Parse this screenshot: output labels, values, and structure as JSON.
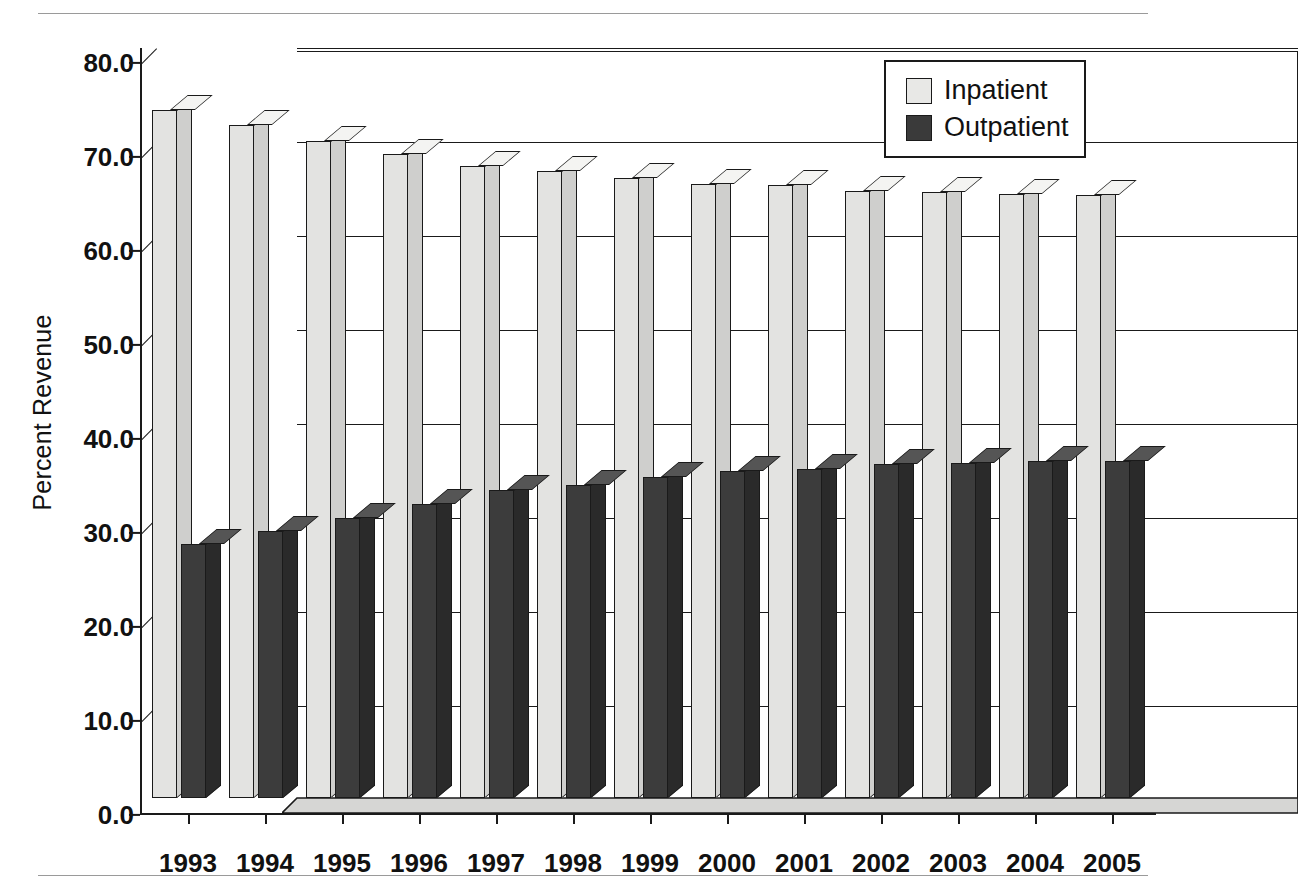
{
  "chart_data": {
    "type": "bar",
    "title": "",
    "xlabel": "",
    "ylabel": "Percent Revenue",
    "categories": [
      "1993",
      "1994",
      "1995",
      "1996",
      "1997",
      "1998",
      "1999",
      "2000",
      "2001",
      "2002",
      "2003",
      "2004",
      "2005"
    ],
    "series": [
      {
        "name": "Inpatient",
        "color": "#e3e3e1",
        "values": [
          73.2,
          71.6,
          69.9,
          68.5,
          67.2,
          66.7,
          66.0,
          65.3,
          65.2,
          64.6,
          64.5,
          64.3,
          64.2
        ]
      },
      {
        "name": "Outpatient",
        "color": "#3c3c3c",
        "values": [
          27.0,
          28.4,
          29.8,
          31.3,
          32.8,
          33.3,
          34.2,
          34.8,
          35.0,
          35.5,
          35.6,
          35.8,
          35.9
        ]
      }
    ],
    "ylim": [
      0.0,
      80.0
    ],
    "yticks": [
      "0.0",
      "10.0",
      "20.0",
      "30.0",
      "40.0",
      "50.0",
      "60.0",
      "70.0",
      "80.0"
    ],
    "ytick_values": [
      0,
      10,
      20,
      30,
      40,
      50,
      60,
      70,
      80
    ],
    "grid": true,
    "legend_position": "top-right",
    "style": "3d-column"
  },
  "legend": {
    "entries": [
      {
        "label": "Inpatient",
        "swatch": "inpatient"
      },
      {
        "label": "Outpatient",
        "swatch": "outpatient"
      }
    ]
  }
}
